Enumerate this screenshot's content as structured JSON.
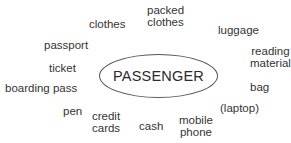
{
  "diagram": {
    "type": "word-web",
    "center": {
      "label": "PASSENGER"
    },
    "words": [
      {
        "id": "clothes",
        "lines": [
          "clothes"
        ]
      },
      {
        "id": "packed-clothes",
        "lines": [
          "packed",
          "clothes"
        ]
      },
      {
        "id": "luggage",
        "lines": [
          "luggage"
        ]
      },
      {
        "id": "reading-material",
        "lines": [
          "reading",
          "material"
        ]
      },
      {
        "id": "passport",
        "lines": [
          "passport"
        ]
      },
      {
        "id": "ticket",
        "lines": [
          "ticket"
        ]
      },
      {
        "id": "boarding-pass",
        "lines": [
          "boarding pass"
        ]
      },
      {
        "id": "bag",
        "lines": [
          "bag"
        ]
      },
      {
        "id": "laptop",
        "lines": [
          "(laptop)"
        ]
      },
      {
        "id": "pen",
        "lines": [
          "pen"
        ]
      },
      {
        "id": "credit-cards",
        "lines": [
          "credit",
          "cards"
        ]
      },
      {
        "id": "cash",
        "lines": [
          "cash"
        ]
      },
      {
        "id": "mobile-phone",
        "lines": [
          "mobile",
          "phone"
        ]
      }
    ]
  }
}
